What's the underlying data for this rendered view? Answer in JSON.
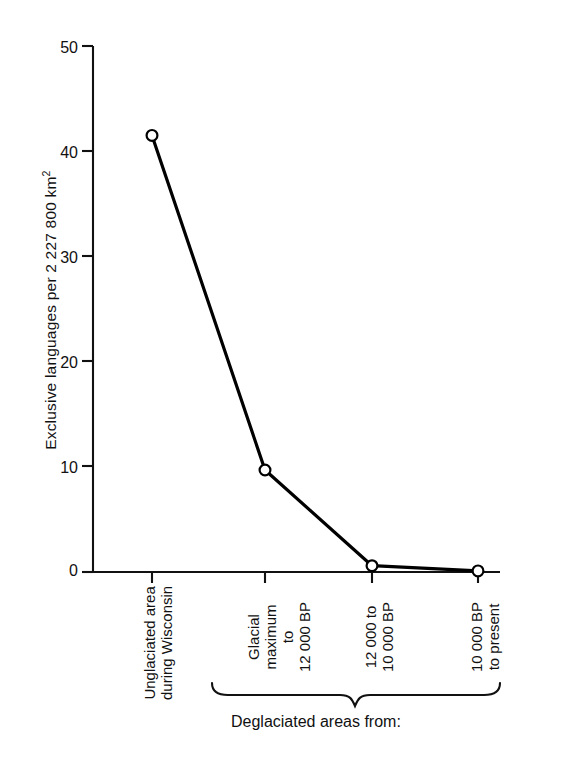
{
  "chart_data": {
    "type": "line",
    "title": "",
    "xlabel": "",
    "ylabel": "Exclusive languages per 2 227 800 km",
    "ylabel_superscript": "2",
    "categories": [
      "Unglaciated area during Wisconsin",
      "Glacial maximum to 12 000 BP",
      "12 000 to 10 000 BP",
      "10 000 BP to present"
    ],
    "category_lines": [
      [
        "Unglaciated area",
        "during Wisconsin"
      ],
      [
        "Glacial",
        "maximum",
        "to",
        "12 000 BP"
      ],
      [
        "12 000 to",
        "10 000 BP"
      ],
      [
        "10 000 BP",
        "to present"
      ]
    ],
    "values": [
      41.5,
      9.7,
      0.6,
      0.1
    ],
    "ylim": [
      0,
      50
    ],
    "yticks": [
      0,
      10,
      20,
      30,
      40,
      50
    ],
    "ytick_labels": [
      "0",
      "10",
      "20",
      "30",
      "40",
      "50"
    ],
    "grid": false,
    "legend": null,
    "marker": "open-circle",
    "line_color": "#000000",
    "marker_face_color": "#ffffff",
    "marker_edge_color": "#000000",
    "group_brace": {
      "label": "Deglaciated areas from:",
      "spans_categories": [
        1,
        2,
        3
      ]
    }
  },
  "axis": {
    "y_title": "Exclusive languages per 2 227 800 km",
    "y_title_sup": "2",
    "tick_labels": {
      "y": [
        "50",
        "40",
        "30",
        "20",
        "10",
        "0"
      ]
    }
  },
  "xlabels": [
    {
      "lines": [
        "Unglaciated area",
        "during Wisconsin"
      ]
    },
    {
      "lines": [
        "Glacial",
        "maximum",
        "to",
        "12 000 BP"
      ]
    },
    {
      "lines": [
        "12 000 to",
        "10 000 BP"
      ]
    },
    {
      "lines": [
        "10 000 BP",
        "to present"
      ]
    }
  ],
  "caption": {
    "brace_label": "Deglaciated areas from:"
  }
}
